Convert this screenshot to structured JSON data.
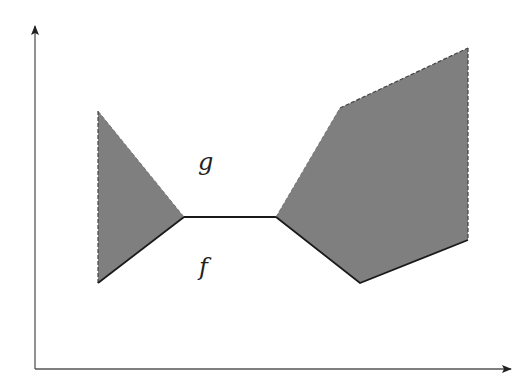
{
  "diagram": {
    "type": "function-region-plot",
    "colors": {
      "background": "#ffffff",
      "fill": "#7f7f7f",
      "axis": "#555555",
      "solid_line": "#1a1a1a",
      "dashed_line": "#444444"
    },
    "axes": {
      "origin": [
        35,
        369
      ],
      "y_arrow_tip": [
        35,
        25
      ],
      "x_arrow_tip": [
        512,
        369
      ]
    },
    "labels": {
      "upper": "g",
      "lower": "f"
    },
    "regions": [
      {
        "name": "left-region",
        "points": [
          [
            98,
            111
          ],
          [
            184,
            217
          ],
          [
            98,
            283
          ]
        ],
        "dashed_edges": [
          [
            [
              98,
              111
            ],
            [
              98,
              283
            ]
          ]
        ],
        "solid_edges": [
          [
            [
              98,
              283
            ],
            [
              184,
              217
            ]
          ]
        ],
        "upper_edge": [
          [
            98,
            111
          ],
          [
            184,
            217
          ]
        ]
      },
      {
        "name": "right-region",
        "points": [
          [
            276,
            217
          ],
          [
            340,
            108
          ],
          [
            468,
            48
          ],
          [
            468,
            240
          ],
          [
            360,
            283
          ]
        ],
        "dashed_edges": [
          [
            [
              340,
              108
            ],
            [
              468,
              48
            ]
          ],
          [
            [
              468,
              48
            ],
            [
              468,
              240
            ]
          ]
        ],
        "solid_edges": [
          [
            [
              276,
              217
            ],
            [
              360,
              283
            ]
          ],
          [
            [
              360,
              283
            ],
            [
              468,
              240
            ]
          ]
        ],
        "upper_edge": [
          [
            276,
            217
          ],
          [
            340,
            108
          ]
        ]
      }
    ],
    "coincident_segment": [
      [
        184,
        217
      ],
      [
        276,
        217
      ]
    ]
  }
}
